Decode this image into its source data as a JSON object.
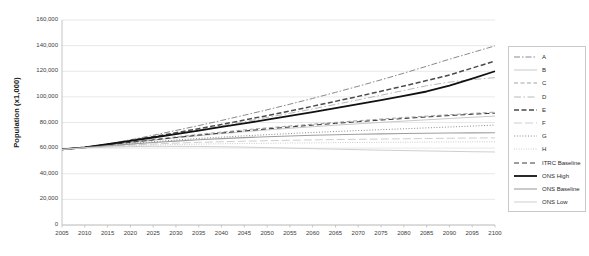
{
  "chart_data": {
    "type": "line",
    "title": "",
    "xlabel": "",
    "ylabel": "Population (x1,000)",
    "xlim": [
      2005,
      2100
    ],
    "ylim": [
      0,
      160000
    ],
    "grid": true,
    "legend_position": "right",
    "x": [
      2005,
      2010,
      2015,
      2020,
      2025,
      2030,
      2035,
      2040,
      2045,
      2050,
      2055,
      2060,
      2065,
      2070,
      2075,
      2080,
      2085,
      2090,
      2095,
      2100
    ],
    "x_tick_labels": [
      "2005",
      "2010",
      "2015",
      "2020",
      "2025",
      "2030",
      "2035",
      "2040",
      "2045",
      "2050",
      "2055",
      "2060",
      "2065",
      "2070",
      "2075",
      "2080",
      "2085",
      "2090",
      "2095",
      "2100"
    ],
    "y_tick_values": [
      0,
      20000,
      40000,
      60000,
      80000,
      100000,
      120000,
      140000,
      160000
    ],
    "y_tick_labels": [
      "0",
      "20,000",
      "40,000",
      "60,000",
      "80,000",
      "100,000",
      "120,000",
      "140,000",
      "160,000"
    ],
    "series": [
      {
        "name": "A",
        "style": "dash-dot",
        "color": "#8a8a8a",
        "width": 1.0,
        "dasharray": "6,2,1.5,2",
        "values": [
          59000,
          60500,
          63200,
          66500,
          70000,
          73800,
          77600,
          81600,
          85700,
          89900,
          94300,
          98800,
          103500,
          108300,
          113300,
          118500,
          123900,
          129400,
          134600,
          139800
        ]
      },
      {
        "name": "B",
        "style": "solid-light",
        "color": "#c2c2c2",
        "width": 0.9,
        "dasharray": "none",
        "values": [
          59000,
          60500,
          62400,
          64300,
          66200,
          68000,
          69700,
          71300,
          72800,
          74200,
          75500,
          76700,
          77900,
          79000,
          80100,
          81100,
          82100,
          83100,
          84100,
          85000
        ]
      },
      {
        "name": "C",
        "style": "dashed",
        "color": "#9a9a9a",
        "width": 0.9,
        "dasharray": "4,2.5",
        "values": [
          59000,
          60500,
          62600,
          64700,
          66800,
          68800,
          70700,
          72500,
          74200,
          75800,
          77300,
          78700,
          80100,
          81400,
          82700,
          83900,
          85000,
          86100,
          87100,
          88100
        ]
      },
      {
        "name": "D",
        "style": "dash-dot-light",
        "color": "#b0b0b0",
        "width": 0.9,
        "dasharray": "7,2.5,1.5,2.5",
        "values": [
          59000,
          60500,
          62900,
          65600,
          68400,
          71300,
          74300,
          77400,
          80600,
          83900,
          87200,
          90600,
          94100,
          97700,
          101300,
          105000,
          108700,
          111500,
          113500,
          115000
        ]
      },
      {
        "name": "E",
        "style": "bold-dashed",
        "color": "#4a4a4a",
        "width": 1.5,
        "dasharray": "5,2.5",
        "values": [
          59000,
          60500,
          63000,
          65900,
          68900,
          72000,
          75200,
          78500,
          81900,
          85400,
          89000,
          92700,
          96500,
          100400,
          104400,
          108500,
          112700,
          117000,
          122500,
          128000
        ]
      },
      {
        "name": "F",
        "style": "long-dash-light",
        "color": "#c8c8c8",
        "width": 0.9,
        "dasharray": "8,3",
        "values": [
          59000,
          60400,
          61500,
          62400,
          63200,
          63900,
          64500,
          65000,
          65400,
          65800,
          66100,
          66400,
          66700,
          66900,
          67100,
          67300,
          67500,
          67700,
          67900,
          68000
        ]
      },
      {
        "name": "G",
        "style": "dotted",
        "color": "#7d7d7d",
        "width": 0.9,
        "dasharray": "1,1.8",
        "values": [
          59000,
          60500,
          62100,
          63600,
          65000,
          66300,
          67500,
          68600,
          69600,
          70500,
          71400,
          72200,
          73000,
          73700,
          74400,
          75100,
          75800,
          76500,
          77200,
          78000
        ]
      },
      {
        "name": "H",
        "style": "fine-dotted",
        "color": "#aeaeae",
        "width": 0.8,
        "dasharray": "0.8,1.6",
        "values": [
          59000,
          60300,
          61200,
          61900,
          62400,
          62800,
          63100,
          63400,
          63600,
          63800,
          64000,
          64100,
          64300,
          64400,
          64500,
          64600,
          64700,
          64800,
          64900,
          65000
        ]
      },
      {
        "name": "ITRC Baseline",
        "style": "dashed",
        "color": "#3a3a3a",
        "width": 1.0,
        "dasharray": "5,3",
        "values": [
          59000,
          60500,
          62500,
          64500,
          66400,
          68300,
          70100,
          71800,
          73400,
          75000,
          76500,
          77900,
          79300,
          80600,
          81900,
          83100,
          84300,
          85400,
          86400,
          87300
        ]
      },
      {
        "name": "ONS High",
        "style": "bold-solid",
        "color": "#111111",
        "width": 1.8,
        "dasharray": "none",
        "values": [
          59000,
          60600,
          63100,
          65700,
          68300,
          71000,
          73700,
          76500,
          79300,
          82200,
          85100,
          88100,
          91200,
          94300,
          97500,
          100800,
          104200,
          108800,
          114200,
          120000
        ]
      },
      {
        "name": "ONS Baseline",
        "style": "solid-gray",
        "color": "#9e9e9e",
        "width": 1.1,
        "dasharray": "none",
        "values": [
          59000,
          60400,
          61800,
          63100,
          64400,
          65500,
          66500,
          67400,
          68200,
          68900,
          69500,
          70000,
          70400,
          70800,
          71100,
          71400,
          71600,
          71800,
          71900,
          72000
        ]
      },
      {
        "name": "ONS Low",
        "style": "solid-lightest",
        "color": "#cfcfcf",
        "width": 1.0,
        "dasharray": "none",
        "values": [
          59000,
          60200,
          60800,
          61200,
          61400,
          61400,
          61300,
          61100,
          60800,
          60400,
          60000,
          59600,
          59200,
          58800,
          58400,
          58100,
          57800,
          57500,
          57200,
          57000
        ]
      }
    ]
  },
  "legend": {
    "items": [
      {
        "label": "A"
      },
      {
        "label": "B"
      },
      {
        "label": "C"
      },
      {
        "label": "D"
      },
      {
        "label": "E"
      },
      {
        "label": "F"
      },
      {
        "label": "G"
      },
      {
        "label": "H"
      },
      {
        "label": "ITRC Baseline"
      },
      {
        "label": "ONS High"
      },
      {
        "label": "ONS Baseline"
      },
      {
        "label": "ONS Low"
      }
    ]
  },
  "colors": {
    "background": "#ffffff",
    "plot_border": "#c9c9c9",
    "gridline": "#e2e2e2",
    "tick_text": "#3d3d3d",
    "axis_title": "#1a1a1a"
  }
}
